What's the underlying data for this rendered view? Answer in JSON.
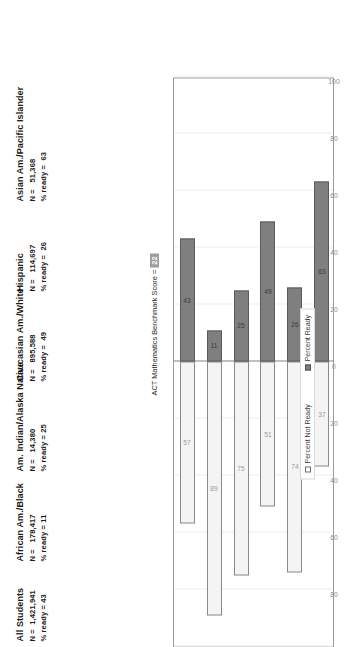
{
  "chart_data": {
    "type": "bar",
    "title": "",
    "orientation": "stacked-diverging-horizontal",
    "xlabel": "",
    "ylabel": "",
    "axis_ticks": [
      "100",
      "80",
      "60",
      "40",
      "20",
      "0",
      "20",
      "40",
      "60",
      "80",
      "100"
    ],
    "axis_range": [
      -100,
      100
    ],
    "grid": true,
    "legend_position": "bottom-right",
    "categories": [
      "All Students",
      "African Am./Black",
      "Am. Indian/Alaska Native",
      "Caucasian Am./White",
      "Hispanic",
      "Asian Am./Pacific Islander"
    ],
    "series": [
      {
        "name": "Percent Ready",
        "values": [
          43,
          11,
          25,
          49,
          26,
          63
        ]
      },
      {
        "name": "Percent Not Ready",
        "values": [
          57,
          89,
          75,
          51,
          74,
          37
        ]
      }
    ]
  },
  "benchmark": {
    "label": "ACT Mathematics Benchmark Score =",
    "value": "22"
  },
  "groups": [
    {
      "name": "All Students",
      "n_label": "N =",
      "n": "1,421,941",
      "ready_label": "% ready =",
      "ready": "43"
    },
    {
      "name": "African Am./Black",
      "n_label": "N =",
      "n": "178,417",
      "ready_label": "% ready =",
      "ready": "11"
    },
    {
      "name": "Am. Indian/Alaska Native",
      "n_label": "N =",
      "n": "14,380",
      "ready_label": "% ready =",
      "ready": "25"
    },
    {
      "name": "Caucasian Am./White",
      "n_label": "N =",
      "n": "895,588",
      "ready_label": "% ready =",
      "ready": "49"
    },
    {
      "name": "Hispanic",
      "n_label": "N =",
      "n": "114,697",
      "ready_label": "% ready =",
      "ready": "26"
    },
    {
      "name": "Asian Am./Pacific Islander",
      "n_label": "N =",
      "n": "51,368",
      "ready_label": "% ready =",
      "ready": "63"
    }
  ],
  "legend": {
    "not_ready": "Percent Not Ready",
    "ready": "Percent Ready"
  },
  "colors": {
    "ready_fill": "#7f7f7f",
    "not_ready_fill": "#f4f4f4",
    "frame": "#9b9b9b",
    "grid": "#ededed",
    "benchmark_badge": "#9d9d9d"
  }
}
